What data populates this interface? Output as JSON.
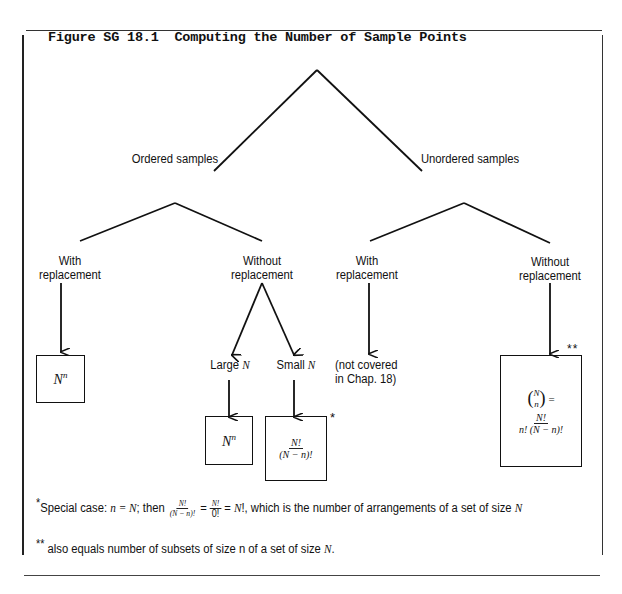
{
  "figure": {
    "title": "Figure SG 18.1  Computing the Number of Sample Points"
  },
  "tree": {
    "level1": {
      "ordered": "Ordered samples",
      "unordered": "Unordered samples"
    },
    "level2": {
      "ordered_with_line1": "With",
      "ordered_with_line2": "replacement",
      "ordered_without_line1": "Without",
      "ordered_without_line2": "replacement",
      "unordered_with_line1": "With",
      "unordered_with_line2": "replacement",
      "unordered_without_line1": "Without",
      "unordered_without_line2": "replacement"
    },
    "level3": {
      "large_prefix": "Large ",
      "large_var": "N",
      "small_prefix": "Small ",
      "small_var": "N",
      "not_covered_line1": "(not covered",
      "not_covered_line2": "in Chap. 18)"
    },
    "results": {
      "ordered_with": {
        "base": "N",
        "exp": "n"
      },
      "large_n": {
        "base": "N",
        "exp": "n"
      },
      "small_n": {
        "num": "N!",
        "den": "(N − n)!",
        "marker": "*"
      },
      "unordered_without": {
        "binom_top": "N",
        "binom_bottom": "n",
        "equals": "=",
        "num": "N!",
        "den": "n! (N − n)!",
        "marker": "**"
      }
    }
  },
  "footnotes": {
    "note1": {
      "marker": "*",
      "text_a": "Special case: ",
      "expr_a": "n = N",
      "text_b": "; then ",
      "frac1_num": "N!",
      "frac1_den": "(N − n)!",
      "eq1": " = ",
      "frac2_num": "N!",
      "frac2_den": "0!",
      "eq2": " = ",
      "expr_b": "N",
      "text_c": "!, which is the number of arrangements of a set of size ",
      "expr_c": "N"
    },
    "note2": {
      "marker": "**",
      "text_a": " also equals number of subsets of size n of a set of size ",
      "expr_a": "N",
      "text_b": "."
    }
  }
}
